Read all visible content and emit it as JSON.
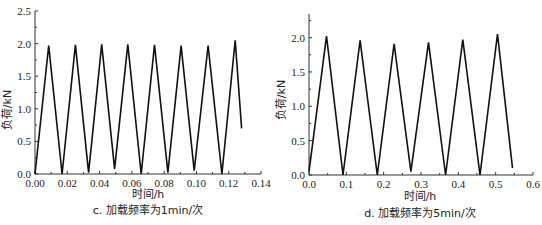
{
  "chart_data": [
    {
      "type": "line",
      "caption": "c. 加载频率为1min/次",
      "xlabel": "时间/h",
      "ylabel": "负荷/kN",
      "xlim": [
        0,
        0.14
      ],
      "ylim": [
        0,
        2.5
      ],
      "xticks": [
        "0.00",
        "0.02",
        "0.04",
        "0.06",
        "0.08",
        "0.10",
        "0.12",
        "0.14"
      ],
      "yticks": [
        "0.0",
        "0.5",
        "1.0",
        "1.5",
        "2.0",
        "2.5"
      ],
      "grid": false,
      "series": [
        {
          "name": "负荷",
          "x": [
            0.0,
            0.0085,
            0.0168,
            0.025,
            0.0332,
            0.0413,
            0.0493,
            0.0575,
            0.0658,
            0.074,
            0.0823,
            0.0905,
            0.0986,
            0.1072,
            0.1158,
            0.124,
            0.128
          ],
          "y": [
            0.0,
            1.97,
            0.0,
            1.98,
            0.02,
            1.99,
            0.08,
            1.99,
            0.0,
            1.98,
            0.02,
            1.97,
            0.05,
            1.97,
            0.0,
            2.05,
            0.7
          ]
        }
      ]
    },
    {
      "type": "line",
      "caption": "d. 加载频率为5min/次",
      "xlabel": "时间/h",
      "ylabel": "负荷/kN",
      "xlim": [
        0,
        0.6
      ],
      "ylim": [
        0,
        2.3
      ],
      "xticks": [
        "0.0",
        "0.1",
        "0.2",
        "0.3",
        "0.4",
        "0.5",
        "0.6"
      ],
      "yticks": [
        "0.0",
        "0.5",
        "1.0",
        "1.5",
        "2.0"
      ],
      "grid": false,
      "series": [
        {
          "name": "负荷",
          "x": [
            0.0,
            0.047,
            0.091,
            0.137,
            0.183,
            0.228,
            0.273,
            0.32,
            0.366,
            0.412,
            0.458,
            0.505,
            0.545
          ],
          "y": [
            0.05,
            2.02,
            0.0,
            1.96,
            0.0,
            1.91,
            0.05,
            1.93,
            0.0,
            1.97,
            0.0,
            2.05,
            0.1
          ]
        }
      ]
    }
  ]
}
